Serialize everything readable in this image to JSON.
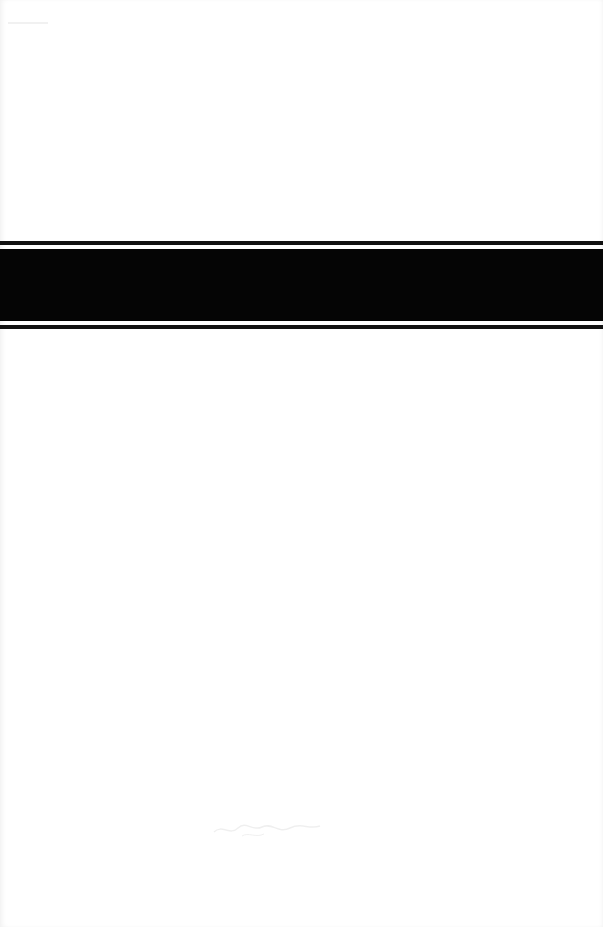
{
  "document": {
    "type": "scanned-page",
    "colors": {
      "background": "#ffffff",
      "band": "#050505",
      "rule": "#111111"
    },
    "decorations": {
      "top_rule": "thin-black-rule",
      "band": "solid-black-band",
      "bottom_rule": "thin-black-rule",
      "bottom_mark": "faint-illegible-handwriting"
    }
  }
}
